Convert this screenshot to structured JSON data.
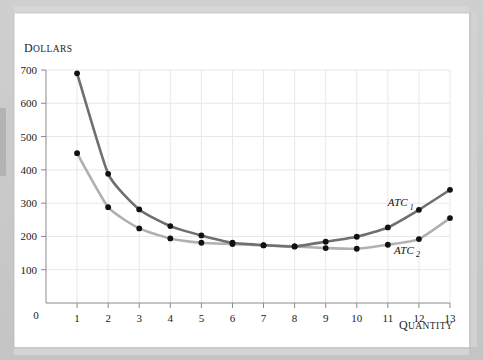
{
  "figure": {
    "y_axis_title": "Dollars",
    "x_axis_title": "Quantity",
    "y_ticks": [
      "0",
      "100",
      "200",
      "300",
      "400",
      "500",
      "600",
      "700"
    ],
    "x_ticks": [
      "0",
      "1",
      "2",
      "3",
      "4",
      "5",
      "6",
      "7",
      "8",
      "9",
      "10",
      "11",
      "12",
      "13"
    ],
    "series_labels": {
      "atc1": "ATC",
      "atc1_sub": "1",
      "atc2": "ATC",
      "atc2_sub": "2"
    },
    "colors": {
      "atc1": "#6f6f6f",
      "atc2": "#b0b0b0",
      "marker": "#111111",
      "grid": "#e8e8e8",
      "axis": "#8a8a8a",
      "card": "#ffffff",
      "page": "#c9c9c9"
    }
  },
  "chart_data": {
    "type": "line",
    "title": "",
    "xlabel": "Quantity",
    "ylabel": "Dollars",
    "xlim": [
      0,
      13
    ],
    "ylim": [
      0,
      700
    ],
    "grid": true,
    "legend": "inline-annotation",
    "x": [
      1,
      2,
      3,
      4,
      5,
      6,
      7,
      8,
      9,
      10,
      11,
      12,
      13
    ],
    "series": [
      {
        "name": "ATC1",
        "color": "#6f6f6f",
        "values": [
          690,
          388,
          281,
          231,
          203,
          181,
          174,
          170,
          184,
          199,
          227,
          280,
          340
        ],
        "annotation": "ATC₁",
        "annotation_x": 11.0,
        "annotation_y": 290
      },
      {
        "name": "ATC2",
        "color": "#b0b0b0",
        "values": [
          450,
          288,
          224,
          194,
          181,
          177,
          173,
          170,
          165,
          163,
          175,
          192,
          255
        ],
        "annotation": "ATC₂",
        "annotation_x": 11.2,
        "annotation_y": 148
      }
    ]
  }
}
